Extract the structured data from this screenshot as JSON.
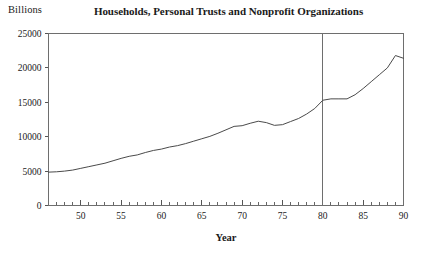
{
  "figure": {
    "unit_label": "Billions",
    "title": "Households, Personal Trusts and Nonprofit Organizations",
    "xlabel": "Year"
  },
  "chart_data": {
    "type": "line",
    "title": "Households, Personal Trusts and Nonprofit Organizations",
    "subtitle": "",
    "unit_label": "Billions",
    "xlabel": "Year",
    "ylabel": "",
    "xlim": [
      1946,
      1990
    ],
    "ylim": [
      0,
      25000
    ],
    "ytick_labels": [
      "0",
      "5000",
      "10000",
      "15000",
      "20000",
      "25000"
    ],
    "ytick_values": [
      0,
      5000,
      10000,
      15000,
      20000,
      25000
    ],
    "xtick_labels": [
      "50",
      "55",
      "60",
      "65",
      "70",
      "75",
      "80",
      "85",
      "90"
    ],
    "xtick_values": [
      1950,
      1955,
      1960,
      1965,
      1970,
      1975,
      1980,
      1985,
      1990
    ],
    "minor_xtick_interval": 1,
    "grid": false,
    "legend": null,
    "annotations": [
      {
        "type": "vertical-line",
        "x": 1980,
        "label": ""
      }
    ],
    "series": [
      {
        "name": "Households, Personal Trusts and Nonprofit Organizations",
        "color": "#4a4a4a",
        "x": [
          1946,
          1947,
          1948,
          1949,
          1950,
          1951,
          1952,
          1953,
          1954,
          1955,
          1956,
          1957,
          1958,
          1959,
          1960,
          1961,
          1962,
          1963,
          1964,
          1965,
          1966,
          1967,
          1968,
          1969,
          1970,
          1971,
          1972,
          1973,
          1974,
          1975,
          1976,
          1977,
          1978,
          1979,
          1980,
          1981,
          1982,
          1983,
          1984,
          1985,
          1986,
          1987,
          1988,
          1989,
          1990
        ],
        "values": [
          4850,
          4900,
          5000,
          5150,
          5400,
          5650,
          5900,
          6150,
          6500,
          6850,
          7150,
          7350,
          7700,
          8000,
          8200,
          8500,
          8700,
          9000,
          9350,
          9700,
          10050,
          10500,
          11000,
          11500,
          11600,
          11950,
          12250,
          12050,
          11650,
          11750,
          12200,
          12650,
          13300,
          14100,
          15300,
          15500,
          15500,
          15500,
          16100,
          17000,
          18000,
          19000,
          20000,
          21800,
          21400
        ]
      }
    ]
  }
}
